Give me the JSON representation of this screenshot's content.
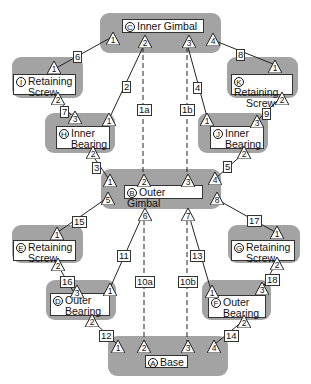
{
  "components": {
    "A": {
      "letter": "A",
      "name": "Base"
    },
    "B": {
      "letter": "B",
      "name": "Outer Gimbal"
    },
    "C": {
      "letter": "C",
      "name": "Inner Gimbal"
    },
    "D": {
      "letter": "D",
      "name_l1": "Outer",
      "name_l2": "Bearing"
    },
    "E": {
      "letter": "E",
      "name_l1": "Retaining",
      "name_l2": "Screw"
    },
    "F": {
      "letter": "F",
      "name_l1": "Outer",
      "name_l2": "Bearing"
    },
    "G": {
      "letter": "G",
      "name_l1": "Retaining",
      "name_l2": "Screw"
    },
    "H": {
      "letter": "H",
      "name_l1": "Inner",
      "name_l2": "Bearing"
    },
    "I": {
      "letter": "I",
      "name_l1": "Retaining",
      "name_l2": "Screw"
    },
    "J": {
      "letter": "J",
      "name_l1": "Inner",
      "name_l2": "Bearing"
    },
    "K": {
      "letter": "K",
      "name_l1": "Retaining",
      "name_l2": "Screw"
    }
  },
  "ports": {
    "C": [
      "1",
      "2",
      "3",
      "4"
    ],
    "I": [
      "1",
      "2"
    ],
    "K": [
      "1",
      "2"
    ],
    "H": [
      "3",
      "1",
      "2"
    ],
    "J": [
      "1",
      "3",
      "2"
    ],
    "B": [
      "1",
      "2",
      "3",
      "4",
      "5",
      "6",
      "7",
      "8"
    ],
    "E": [
      "1",
      "2"
    ],
    "G": [
      "1",
      "2"
    ],
    "D": [
      "3",
      "1",
      "2"
    ],
    "F": [
      "1",
      "3",
      "2"
    ],
    "A": [
      "1",
      "2",
      "3",
      "4"
    ]
  },
  "connections": {
    "c1": "1a",
    "c2": "1b",
    "c3": "2",
    "c4": "3",
    "c5": "4",
    "c6": "5",
    "c7": "6",
    "c8": "7",
    "c9": "8",
    "c10": "9",
    "c11": "10a",
    "c12": "10b",
    "c13": "11",
    "c14": "12",
    "c15": "13",
    "c16": "14",
    "c17": "15",
    "c18": "16",
    "c19": "17",
    "c20": "18"
  },
  "colors": {
    "group_fill": "#a3a3a3",
    "line": "#222222",
    "label_bg": "#ffffff"
  }
}
